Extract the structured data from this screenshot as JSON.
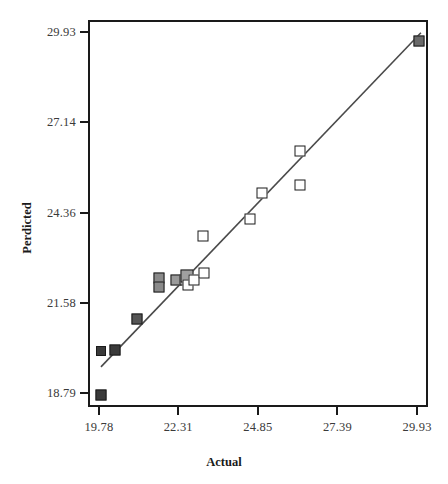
{
  "chart_data": {
    "type": "scatter",
    "title": "",
    "xlabel": "Actual",
    "ylabel": "Perdicted",
    "xlim": [
      19.43,
      30.28
    ],
    "ylim": [
      18.36,
      30.3
    ],
    "xticks": [
      "19.78",
      "22.31",
      "24.85",
      "27.39",
      "29.93"
    ],
    "yticks": [
      "29.93",
      "27.14",
      "24.36",
      "21.58",
      "18.79"
    ],
    "xtick_values": [
      19.78,
      22.31,
      24.85,
      27.39,
      29.93
    ],
    "ytick_values": [
      29.93,
      27.14,
      24.36,
      21.58,
      18.79
    ],
    "grid": false,
    "legend": null,
    "series": [
      {
        "name": "Actual vs Perdicted",
        "marker": "square",
        "points": [
          {
            "x": 19.78,
            "y": 18.79,
            "fill": "#3a3a3a",
            "size": 11
          },
          {
            "x": 19.78,
            "y": 20.16,
            "fill": "#3a3a3a",
            "size": 10
          },
          {
            "x": 20.24,
            "y": 20.19,
            "fill": "#3a3a3a",
            "size": 11
          },
          {
            "x": 20.93,
            "y": 21.13,
            "fill": "#555555",
            "size": 11
          },
          {
            "x": 21.62,
            "y": 22.4,
            "fill": "#8a8a8a",
            "size": 11
          },
          {
            "x": 21.62,
            "y": 22.13,
            "fill": "#8a8a8a",
            "size": 11
          },
          {
            "x": 22.17,
            "y": 22.33,
            "fill": "#9a9a9a",
            "size": 11
          },
          {
            "x": 22.45,
            "y": 22.33,
            "fill": "#a5a5a5",
            "size": 11
          },
          {
            "x": 22.52,
            "y": 22.46,
            "fill": "#a0a0a0",
            "size": 13
          },
          {
            "x": 22.56,
            "y": 22.19,
            "fill": "#ffffff",
            "size": 11
          },
          {
            "x": 22.75,
            "y": 22.33,
            "fill": "#ffffff",
            "size": 11
          },
          {
            "x": 23.07,
            "y": 22.55,
            "fill": "#ffffff",
            "size": 11
          },
          {
            "x": 23.05,
            "y": 23.69,
            "fill": "#ffffff",
            "size": 11
          },
          {
            "x": 24.52,
            "y": 24.21,
            "fill": "#ffffff",
            "size": 11
          },
          {
            "x": 24.93,
            "y": 25.01,
            "fill": "#ffffff",
            "size": 11
          },
          {
            "x": 26.12,
            "y": 26.33,
            "fill": "#ffffff",
            "size": 11
          },
          {
            "x": 26.14,
            "y": 25.26,
            "fill": "#ffffff",
            "size": 11
          },
          {
            "x": 29.93,
            "y": 29.7,
            "fill": "#6a6a6a",
            "size": 11
          }
        ]
      }
    ],
    "fit_line": {
      "name": "reference-fit-line",
      "x_start": 19.78,
      "y_start": 19.66,
      "x_end": 29.99,
      "y_end": 29.97,
      "color": "#4a4a4a"
    }
  }
}
